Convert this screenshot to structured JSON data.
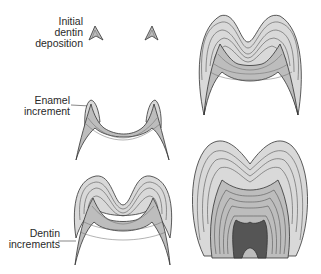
{
  "figure": {
    "labels": {
      "initial_dentin": [
        "Initial",
        "dentin",
        "deposition"
      ],
      "enamel_increment": [
        "Enamel",
        "increment"
      ],
      "dentin_increments": [
        "Dentin",
        "increments"
      ]
    },
    "stages": [
      {
        "id": 1,
        "name": "initial-dentin-deposition",
        "position": "top-left"
      },
      {
        "id": 2,
        "name": "first-enamel-increment",
        "position": "middle-left"
      },
      {
        "id": 3,
        "name": "multiple-increments",
        "position": "bottom-left"
      },
      {
        "id": 4,
        "name": "advanced-crown",
        "position": "top-right"
      },
      {
        "id": 5,
        "name": "complete-crown-with-pulp",
        "position": "bottom-right"
      }
    ],
    "colors": {
      "enamel_fill": "#d9d9d9",
      "dentin_fill": "#bdbdbd",
      "pulp_fill": "#555555",
      "outline": "#333333",
      "increment_line": "#6a6a6a"
    }
  }
}
